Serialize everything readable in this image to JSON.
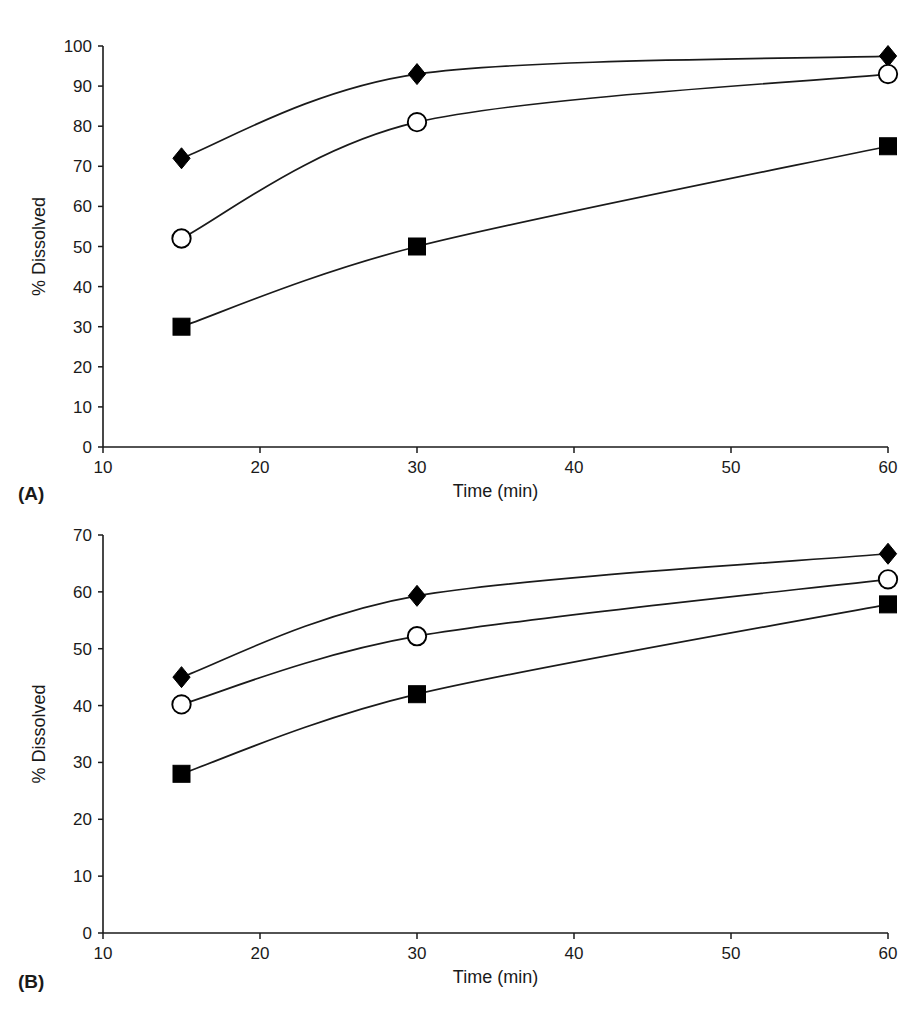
{
  "figure": {
    "background_color": "#ffffff",
    "ink_color": "#000000",
    "top_edge_artifact": "—  ————  —"
  },
  "panels": [
    {
      "letter": "(A)",
      "xlabel": "Time (min)",
      "ylabel": "% Dissolved"
    },
    {
      "letter": "(B)",
      "xlabel": "Time (min)",
      "ylabel": "% Dissolved"
    }
  ],
  "chart_data": [
    {
      "type": "line",
      "title": "",
      "panel": "(A)",
      "xlabel": "Time (min)",
      "ylabel": "% Dissolved",
      "x": [
        15,
        30,
        60
      ],
      "xlim": [
        10,
        60
      ],
      "ylim": [
        0,
        100
      ],
      "xticks": [
        10,
        20,
        30,
        40,
        50,
        60
      ],
      "yticks": [
        0,
        10,
        20,
        30,
        40,
        50,
        60,
        70,
        80,
        90,
        100
      ],
      "xtick_labels": [
        "10",
        "20",
        "30",
        "40",
        "50",
        "60"
      ],
      "ytick_labels": [
        "0",
        "10",
        "20",
        "30",
        "40",
        "50",
        "60",
        "70",
        "80",
        "90",
        "100"
      ],
      "grid": false,
      "legend": "none",
      "series": [
        {
          "name": "filled-diamond",
          "marker": "filled-diamond",
          "values": [
            72,
            93,
            97.5
          ]
        },
        {
          "name": "open-circle",
          "marker": "open-circle",
          "values": [
            52,
            81,
            93
          ]
        },
        {
          "name": "filled-square",
          "marker": "filled-square",
          "values": [
            30,
            50,
            75
          ]
        }
      ]
    },
    {
      "type": "line",
      "title": "",
      "panel": "(B)",
      "xlabel": "Time (min)",
      "ylabel": "% Dissolved",
      "x": [
        15,
        30,
        60
      ],
      "xlim": [
        10,
        60
      ],
      "ylim": [
        0,
        70
      ],
      "xticks": [
        10,
        20,
        30,
        40,
        50,
        60
      ],
      "yticks": [
        0,
        10,
        20,
        30,
        40,
        50,
        60,
        70
      ],
      "xtick_labels": [
        "10",
        "20",
        "30",
        "40",
        "50",
        "60"
      ],
      "ytick_labels": [
        "0",
        "10",
        "20",
        "30",
        "40",
        "50",
        "60",
        "70"
      ],
      "grid": false,
      "legend": "none",
      "series": [
        {
          "name": "filled-diamond",
          "marker": "filled-diamond",
          "values": [
            45,
            59.3,
            66.7
          ]
        },
        {
          "name": "open-circle",
          "marker": "open-circle",
          "values": [
            40.2,
            52.2,
            62.2
          ]
        },
        {
          "name": "filled-square",
          "marker": "filled-square",
          "values": [
            28,
            42,
            57.8
          ]
        }
      ]
    }
  ]
}
